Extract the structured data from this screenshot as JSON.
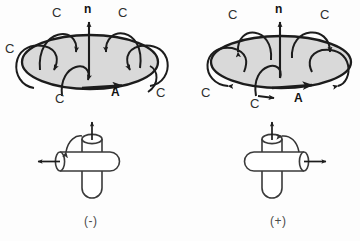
{
  "figure": {
    "background_color": "#fdfdfd",
    "ink_color": "#1c1c1c",
    "surface_fill_color": "#d9d9d9",
    "label_color": "#2e2e2e"
  },
  "panels": [
    {
      "id": "left",
      "sign_label": "(-)",
      "vector_normal_label": "n",
      "vector_area_label": "A",
      "circulation_labels": [
        "C",
        "C",
        "C",
        "C",
        "C",
        "C"
      ],
      "circulation_label_positions": [
        {
          "text": "C",
          "x": 52,
          "y": 6
        },
        {
          "text": "C",
          "x": 118,
          "y": 6
        },
        {
          "text": "C",
          "x": 5,
          "y": 42
        },
        {
          "text": "C",
          "x": 55,
          "y": 92
        },
        {
          "text": "C",
          "x": 156,
          "y": 86
        },
        {
          "text": "C",
          "x": 113,
          "y": 86
        }
      ],
      "normal_label_position": {
        "x": 84,
        "y": 3
      },
      "area_label_position": {
        "x": 111,
        "y": 86
      },
      "sign_label_position": {
        "x": 84,
        "y": 215
      }
    },
    {
      "id": "right",
      "sign_label": "(+)",
      "vector_normal_label": "n",
      "vector_area_label": "A",
      "circulation_labels": [
        "C",
        "C",
        "C",
        "C"
      ],
      "circulation_label_positions": [
        {
          "text": "C",
          "x": 228,
          "y": 8
        },
        {
          "text": "C",
          "x": 320,
          "y": 8
        },
        {
          "text": "C",
          "x": 201,
          "y": 86
        },
        {
          "text": "C",
          "x": 250,
          "y": 97
        }
      ],
      "normal_label_position": {
        "x": 275,
        "y": 3
      },
      "area_label_position": {
        "x": 294,
        "y": 92
      },
      "sign_label_position": {
        "x": 270,
        "y": 215
      }
    }
  ],
  "cylinder_diagrams": [
    {
      "id": "left-cylinder",
      "sign_label": "(-)",
      "horizontal_arrow_direction": "left",
      "vertical_arrow_direction": "up",
      "rotation_arrow": "counterclockwise"
    },
    {
      "id": "right-cylinder",
      "sign_label": "(+)",
      "horizontal_arrow_direction": "right",
      "vertical_arrow_direction": "up",
      "rotation_arrow": "clockwise"
    }
  ]
}
